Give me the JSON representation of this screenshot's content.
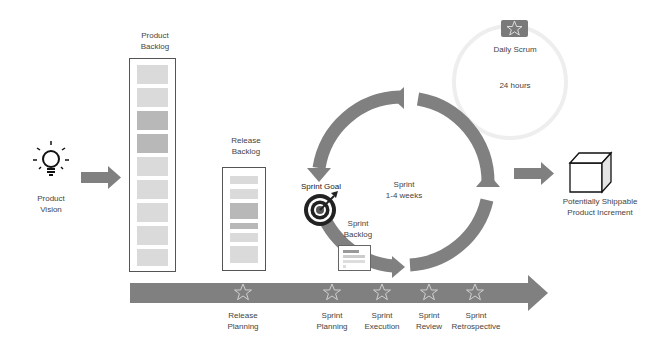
{
  "product_vision": {
    "line1": "Product",
    "line2": "Vision",
    "icon": "lightbulb-icon"
  },
  "product_backlog": {
    "line1": "Product",
    "line2": "Backlog",
    "items": 9,
    "highlighted_items": [
      3,
      4
    ]
  },
  "release_backlog": {
    "line1": "Release",
    "line2": "Backlog"
  },
  "sprint_goal": {
    "label": "Sprint Goal",
    "icon": "target-icon"
  },
  "sprint_backlog": {
    "line1": "Sprint",
    "line2": "Backlog"
  },
  "sprint_cycle": {
    "line1": "Sprint",
    "line2": "1-4 weeks"
  },
  "daily_scrum": {
    "label": "Daily Scrum",
    "duration": "24 hours",
    "icon": "star-icon"
  },
  "increment": {
    "line1": "Potentially Shippable",
    "line2": "Product Increment",
    "icon": "cube-icon"
  },
  "timeline": {
    "events": [
      {
        "line1": "Release",
        "line2": "Planning"
      },
      {
        "line1": "Sprint",
        "line2": "Planning"
      },
      {
        "line1": "Sprint",
        "line2": "Execution"
      },
      {
        "line1": "Sprint",
        "line2": "Review"
      },
      {
        "line1": "Sprint",
        "line2": "Retrospective"
      }
    ]
  },
  "colors": {
    "arrow": "#7f7f7f",
    "text": "#444444",
    "backlog_item": "#dadada",
    "backlog_item_dark": "#b8b8b8"
  }
}
